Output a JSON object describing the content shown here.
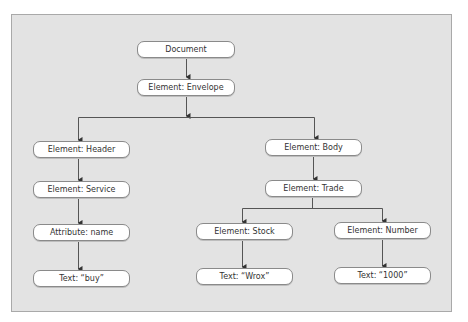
{
  "diagram": {
    "type": "tree",
    "title": "",
    "nodes": {
      "document": "Document",
      "envelope": "Element: Envelope",
      "header": "Element: Header",
      "service": "Element: Service",
      "attribute_name": "Attribute: name",
      "text_buy": "Text: “buy”",
      "body": "Element: Body",
      "trade": "Element: Trade",
      "stock": "Element: Stock",
      "number": "Element: Number",
      "text_wrox": "Text: “Wrox”",
      "text_1000": "Text: “1000”"
    },
    "edges": [
      [
        "document",
        "envelope"
      ],
      [
        "envelope",
        "header"
      ],
      [
        "envelope",
        "body"
      ],
      [
        "header",
        "service"
      ],
      [
        "service",
        "attribute_name"
      ],
      [
        "attribute_name",
        "text_buy"
      ],
      [
        "body",
        "trade"
      ],
      [
        "trade",
        "stock"
      ],
      [
        "trade",
        "number"
      ],
      [
        "stock",
        "text_wrox"
      ],
      [
        "number",
        "text_1000"
      ]
    ],
    "colors": {
      "panel_background": "#e3e3e3",
      "panel_border": "#a9a9a9",
      "node_fill": "#ffffff",
      "node_border": "#8a8a8a",
      "edge": "#555555",
      "text": "#333333"
    }
  }
}
